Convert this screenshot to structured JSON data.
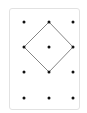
{
  "diagram": {
    "type": "geoboard",
    "grid": {
      "columns": 3,
      "rows": 4
    },
    "dots": [
      {
        "col": 0,
        "row": 0
      },
      {
        "col": 1,
        "row": 0
      },
      {
        "col": 2,
        "row": 0
      },
      {
        "col": 0,
        "row": 1
      },
      {
        "col": 1,
        "row": 1
      },
      {
        "col": 2,
        "row": 1
      },
      {
        "col": 0,
        "row": 2
      },
      {
        "col": 1,
        "row": 2
      },
      {
        "col": 2,
        "row": 2
      },
      {
        "col": 0,
        "row": 3
      },
      {
        "col": 1,
        "row": 3
      },
      {
        "col": 2,
        "row": 3
      }
    ],
    "shape": {
      "name": "square (diamond)",
      "vertices": [
        {
          "col": 1,
          "row": 0
        },
        {
          "col": 2,
          "row": 1
        },
        {
          "col": 1,
          "row": 2
        },
        {
          "col": 0,
          "row": 1
        }
      ]
    },
    "colors": {
      "dot": "#111111",
      "line": "#777777",
      "border": "#e2e2e2"
    }
  }
}
